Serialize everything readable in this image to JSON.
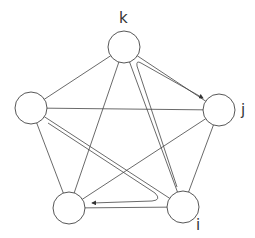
{
  "diagram": {
    "type": "complete-graph-K5",
    "nodes": [
      {
        "id": "k",
        "label": "k",
        "cx": 124,
        "cy": 47
      },
      {
        "id": "j",
        "label": "j",
        "cx": 219,
        "cy": 110
      },
      {
        "id": "i",
        "label": "i",
        "cx": 183,
        "cy": 207
      },
      {
        "id": "b",
        "label": "",
        "cx": 69,
        "cy": 208
      },
      {
        "id": "l",
        "label": "",
        "cx": 31,
        "cy": 108
      }
    ],
    "edges": [
      [
        "k",
        "j"
      ],
      [
        "k",
        "i"
      ],
      [
        "k",
        "b"
      ],
      [
        "k",
        "l"
      ],
      [
        "j",
        "i"
      ],
      [
        "j",
        "b"
      ],
      [
        "j",
        "l"
      ],
      [
        "i",
        "b"
      ],
      [
        "i",
        "l"
      ],
      [
        "b",
        "l"
      ]
    ],
    "highlighted_path": {
      "description": "path from i toward k then to j (arrow at j); path from l down to i then to bottom-left node (arrow)",
      "segments": [
        [
          "i",
          "k",
          "j"
        ],
        [
          "l",
          "i",
          "b"
        ]
      ]
    },
    "labels": {
      "k": "k",
      "j": "j",
      "i": "i"
    }
  }
}
